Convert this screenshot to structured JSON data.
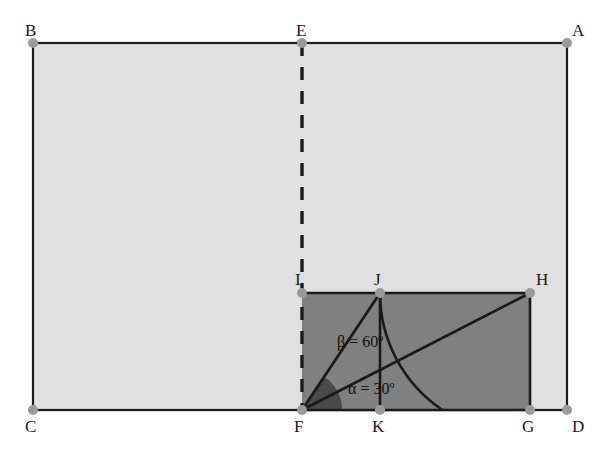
{
  "figure": {
    "background_color": "#ffffff",
    "outer_rect_fill": "#e0e0e0",
    "inner_rect_fill": "#808080",
    "angle_sector_fill": "#4a4a4a",
    "stroke_color": "#1a1a1a",
    "vertex_dot_color": "#9a9a9a",
    "dashed_stroke_color": "#1a1a1a"
  },
  "points": [
    {
      "id": "A",
      "label": "A",
      "x": 567,
      "y": 43,
      "label_x": 572,
      "label_y": 22,
      "dot": true
    },
    {
      "id": "B",
      "label": "B",
      "x": 33,
      "y": 43,
      "label_x": 25,
      "label_y": 22,
      "dot": true
    },
    {
      "id": "C",
      "label": "C",
      "x": 33,
      "y": 410,
      "label_x": 25,
      "label_y": 418,
      "dot": true
    },
    {
      "id": "D",
      "label": "D",
      "x": 567,
      "y": 410,
      "label_x": 572,
      "label_y": 418,
      "dot": true
    },
    {
      "id": "E",
      "label": "E",
      "x": 302,
      "y": 43,
      "label_x": 296,
      "label_y": 22,
      "dot": true
    },
    {
      "id": "F",
      "label": "F",
      "x": 302,
      "y": 410,
      "label_x": 294,
      "label_y": 418,
      "dot": true
    },
    {
      "id": "G",
      "label": "G",
      "x": 530,
      "y": 410,
      "label_x": 522,
      "label_y": 418,
      "dot": true
    },
    {
      "id": "H",
      "label": "H",
      "x": 530,
      "y": 293,
      "label_x": 536,
      "label_y": 271,
      "dot": true
    },
    {
      "id": "I",
      "label": "I",
      "x": 302,
      "y": 293,
      "label_x": 295,
      "label_y": 271,
      "dot": true
    },
    {
      "id": "J",
      "label": "J",
      "x": 380,
      "y": 293,
      "label_x": 374,
      "label_y": 271,
      "dot": true
    },
    {
      "id": "K",
      "label": "K",
      "x": 380,
      "y": 410,
      "label_x": 372,
      "label_y": 418,
      "dot": true
    }
  ],
  "shapes": {
    "outer_rectangle": {
      "name": "ABDC",
      "x": 33,
      "y": 43,
      "width": 534,
      "height": 367
    },
    "inner_rectangle": {
      "name": "IHGF",
      "x": 302,
      "y": 293,
      "width": 228,
      "height": 117
    }
  },
  "segments": [
    {
      "name": "B-A",
      "from": "B",
      "to": "A",
      "style": "solid"
    },
    {
      "name": "B-C",
      "from": "B",
      "to": "C",
      "style": "solid"
    },
    {
      "name": "C-D",
      "from": "C",
      "to": "D",
      "style": "solid"
    },
    {
      "name": "A-D",
      "from": "A",
      "to": "D",
      "style": "solid"
    },
    {
      "name": "E-F",
      "from": "E",
      "to": "F",
      "style": "dashed"
    },
    {
      "name": "I-H",
      "from": "I",
      "to": "H",
      "style": "solid"
    },
    {
      "name": "H-G",
      "from": "H",
      "to": "G",
      "style": "solid"
    },
    {
      "name": "F-J",
      "from": "F",
      "to": "J",
      "style": "solid"
    },
    {
      "name": "F-H",
      "from": "F",
      "to": "H",
      "style": "solid"
    },
    {
      "name": "J-K",
      "from": "J",
      "to": "K",
      "style": "solid"
    }
  ],
  "arcs": [
    {
      "name": "arc-radius-FJ",
      "center": "F",
      "radius": 140,
      "from_deg": 57,
      "to_deg": 0
    }
  ],
  "angles": [
    {
      "id": "alpha",
      "label": "α = 30º",
      "symbol": "α",
      "value": 30,
      "unit": "º",
      "vertex": "F",
      "label_x": 348,
      "label_y": 381
    },
    {
      "id": "beta",
      "label": "β = 60º",
      "symbol": "β",
      "value": 60,
      "unit": "º",
      "vertex": "F",
      "label_x": 337,
      "label_y": 334
    }
  ]
}
